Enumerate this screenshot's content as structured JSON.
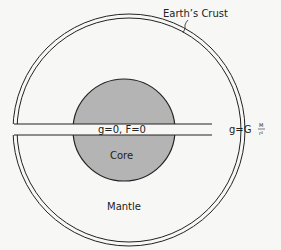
{
  "diagram": {
    "labels": {
      "crust": "Earth’s Crust",
      "core": "Core",
      "mantle": "Mantle",
      "center_equation": "g=0, F=0",
      "surface_equation_lhs": "g=G",
      "surface_equation_num": "M",
      "surface_equation_den": "r²"
    },
    "colors": {
      "core_fill": "#b4b4b4",
      "line": "#222222",
      "background": "#f7f7f5"
    }
  }
}
